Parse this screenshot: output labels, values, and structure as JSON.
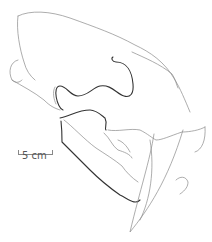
{
  "figure": {
    "scale_bar": {
      "label": "5 cm"
    }
  }
}
